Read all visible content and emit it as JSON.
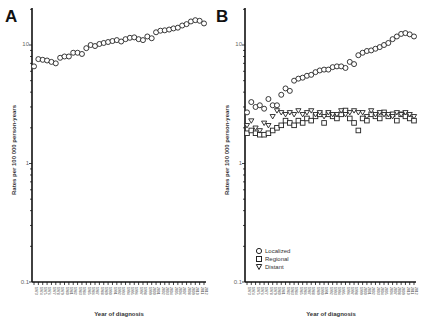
{
  "figure": {
    "panels": [
      "A",
      "B"
    ]
  },
  "chart_data": [
    {
      "type": "scatter",
      "panel": "A",
      "title": "",
      "xlabel": "Year of diagnosis",
      "ylabel": "Rates per 100 000 person-years",
      "yscale": "log",
      "ylim": [
        0.1,
        20
      ],
      "yticks": [
        "0.1",
        "1",
        "10"
      ],
      "x": [
        1973,
        1974,
        1975,
        1976,
        1977,
        1978,
        1979,
        1980,
        1981,
        1982,
        1983,
        1984,
        1985,
        1986,
        1987,
        1988,
        1989,
        1990,
        1991,
        1992,
        1993,
        1994,
        1995,
        1996,
        1997,
        1998,
        1999,
        2000,
        2001,
        2002,
        2003,
        2004,
        2005,
        2006,
        2007,
        2008,
        2009,
        2010,
        2011,
        2012
      ],
      "series": [
        {
          "name": "All stages",
          "marker": "circle",
          "values": [
            6.6,
            7.6,
            7.5,
            7.4,
            7.2,
            7.0,
            7.8,
            8.0,
            8.0,
            8.6,
            8.6,
            8.4,
            9.4,
            10.0,
            9.8,
            10.2,
            10.4,
            10.6,
            10.8,
            11.0,
            10.7,
            11.2,
            11.5,
            11.6,
            11.2,
            11.0,
            11.8,
            11.4,
            12.8,
            13.2,
            13.3,
            13.5,
            13.8,
            14.0,
            14.6,
            15.0,
            15.8,
            16.2,
            16.0,
            15.2
          ]
        }
      ],
      "grid": false,
      "legend": null
    },
    {
      "type": "scatter",
      "panel": "B",
      "title": "",
      "xlabel": "Year of diagnosis",
      "ylabel": "Rates per 100 000 person-years",
      "yscale": "log",
      "ylim": [
        0.1,
        20
      ],
      "yticks": [
        "0.1",
        "1",
        "10"
      ],
      "x": [
        1973,
        1974,
        1975,
        1976,
        1977,
        1978,
        1979,
        1980,
        1981,
        1982,
        1983,
        1984,
        1985,
        1986,
        1987,
        1988,
        1989,
        1990,
        1991,
        1992,
        1993,
        1994,
        1995,
        1996,
        1997,
        1998,
        1999,
        2000,
        2001,
        2002,
        2003,
        2004,
        2005,
        2006,
        2007,
        2008,
        2009,
        2010,
        2011,
        2012
      ],
      "series": [
        {
          "name": "Localized",
          "marker": "circle",
          "values": [
            2.7,
            3.3,
            3.0,
            3.1,
            2.9,
            3.5,
            3.1,
            3.1,
            3.8,
            4.3,
            4.1,
            5.0,
            5.2,
            5.3,
            5.5,
            5.6,
            5.9,
            6.1,
            6.2,
            6.2,
            6.5,
            6.6,
            6.6,
            6.4,
            7.2,
            6.9,
            8.2,
            8.6,
            8.9,
            9.0,
            9.3,
            9.6,
            10.0,
            10.4,
            11.2,
            11.8,
            12.4,
            12.6,
            12.3,
            11.8
          ]
        },
        {
          "name": "Regional",
          "marker": "square",
          "values": [
            1.8,
            1.9,
            1.8,
            1.75,
            1.75,
            1.8,
            1.9,
            2.0,
            2.1,
            2.3,
            2.2,
            2.1,
            2.3,
            2.2,
            2.4,
            2.3,
            2.5,
            2.6,
            2.2,
            2.6,
            2.5,
            2.4,
            2.6,
            2.8,
            2.4,
            2.2,
            1.9,
            2.4,
            2.3,
            2.6,
            2.5,
            2.4,
            2.7,
            2.5,
            2.6,
            2.3,
            2.6,
            2.5,
            2.4,
            2.3
          ]
        },
        {
          "name": "Distant",
          "marker": "triangle-down",
          "values": [
            2.1,
            2.3,
            2.0,
            1.9,
            2.2,
            2.1,
            2.5,
            2.8,
            2.7,
            2.6,
            2.7,
            2.6,
            2.8,
            2.6,
            2.7,
            2.8,
            2.6,
            2.7,
            2.5,
            2.7,
            2.6,
            2.6,
            2.8,
            2.6,
            2.7,
            2.8,
            2.7,
            2.7,
            2.5,
            2.8,
            2.6,
            2.7,
            2.6,
            2.6,
            2.5,
            2.7,
            2.6,
            2.7,
            2.6,
            2.5
          ]
        }
      ],
      "grid": false,
      "legend": {
        "position": "lower-left inside",
        "entries": [
          "Localized",
          "Regional",
          "Distant"
        ]
      }
    }
  ],
  "panelA": {
    "label": "A",
    "ylabel": "Rates per 100 000 person-years",
    "xlabel": "Year of diagnosis",
    "ytick_top": "10",
    "ytick_mid": "1",
    "ytick_bottom": "0.1"
  },
  "panelB": {
    "label": "B",
    "ylabel": "Rates per 100 000 person-years",
    "xlabel": "Year of diagnosis",
    "ytick_top": "10",
    "ytick_mid": "1",
    "ytick_bottom": "0.1",
    "legend": {
      "localized": "Localized",
      "regional": "Regional",
      "distant": "Distant"
    }
  }
}
